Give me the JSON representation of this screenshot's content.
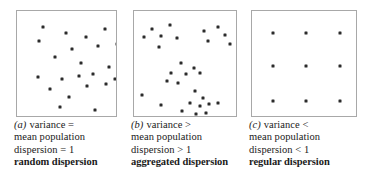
{
  "figure": {
    "type": "scatter-panels",
    "panel_count": 3,
    "dot_color": "#2b2b2b",
    "box_border_color": "#a8a8a8",
    "background": "#ffffff"
  },
  "panels": [
    {
      "letter": "(a)",
      "caption_lines": [
        "variance =",
        "mean population",
        "dispersion = 1"
      ],
      "bold_label": "random dispersion",
      "box": {
        "left": 16,
        "top": 10,
        "width": 101,
        "height": 107
      },
      "caption_left": 14,
      "points": [
        [
          26,
          16
        ],
        [
          49,
          22
        ],
        [
          88,
          18
        ],
        [
          110,
          17
        ],
        [
          22,
          30
        ],
        [
          69,
          26
        ],
        [
          100,
          33
        ],
        [
          55,
          38
        ],
        [
          81,
          35
        ],
        [
          38,
          46
        ],
        [
          107,
          47
        ],
        [
          64,
          52
        ],
        [
          92,
          56
        ],
        [
          21,
          66
        ],
        [
          45,
          68
        ],
        [
          62,
          65
        ],
        [
          76,
          63
        ],
        [
          98,
          68
        ],
        [
          33,
          78
        ],
        [
          70,
          75
        ],
        [
          89,
          73
        ],
        [
          52,
          86
        ],
        [
          109,
          80
        ],
        [
          43,
          96
        ],
        [
          78,
          99
        ],
        [
          59,
          107
        ],
        [
          104,
          103
        ]
      ]
    },
    {
      "letter": "(b)",
      "caption_lines": [
        "variance >",
        "mean population",
        "dispersion > 1"
      ],
      "bold_label": "aggregated dispersion",
      "box": {
        "left": 133,
        "top": 10,
        "width": 104,
        "height": 107
      },
      "caption_left": 131,
      "points": [
        [
          18,
          18
        ],
        [
          36,
          14
        ],
        [
          10,
          26
        ],
        [
          27,
          25
        ],
        [
          43,
          27
        ],
        [
          25,
          36
        ],
        [
          70,
          20
        ],
        [
          84,
          16
        ],
        [
          91,
          24
        ],
        [
          74,
          30
        ],
        [
          96,
          33
        ],
        [
          47,
          52
        ],
        [
          60,
          57
        ],
        [
          37,
          62
        ],
        [
          52,
          63
        ],
        [
          66,
          62
        ],
        [
          44,
          72
        ],
        [
          33,
          70
        ],
        [
          8,
          84
        ],
        [
          27,
          94
        ],
        [
          61,
          80
        ],
        [
          69,
          87
        ],
        [
          56,
          92
        ],
        [
          66,
          95
        ],
        [
          75,
          93
        ],
        [
          84,
          92
        ],
        [
          48,
          100
        ],
        [
          62,
          103
        ],
        [
          72,
          102
        ]
      ]
    },
    {
      "letter": "(c)",
      "caption_lines": [
        "variance <",
        "mean population",
        "dispersion < 1"
      ],
      "bold_label": "regular dispersion",
      "box": {
        "left": 251,
        "top": 10,
        "width": 106,
        "height": 107
      },
      "caption_left": 249,
      "points": [
        [
          21,
          22
        ],
        [
          54,
          22
        ],
        [
          88,
          22
        ],
        [
          21,
          55
        ],
        [
          54,
          55
        ],
        [
          88,
          55
        ],
        [
          21,
          90
        ],
        [
          54,
          90
        ],
        [
          88,
          90
        ]
      ]
    }
  ]
}
